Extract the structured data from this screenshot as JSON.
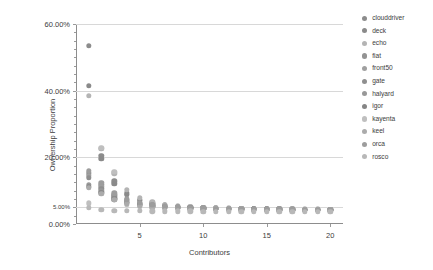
{
  "chart_data": {
    "type": "scatter",
    "title": "",
    "xlabel": "Contributors",
    "ylabel": "Ownership Proportion",
    "xlim": [
      0,
      21
    ],
    "ylim": [
      0,
      0.6
    ],
    "grid": true,
    "legend_position": "right",
    "y_ticks": [
      {
        "value": 0.0,
        "label": "0.00%",
        "size": "normal"
      },
      {
        "value": 0.05,
        "label": "5.00%",
        "size": "small"
      },
      {
        "value": 0.2,
        "label": "20.00%",
        "size": "normal"
      },
      {
        "value": 0.4,
        "label": "40.00%",
        "size": "normal"
      },
      {
        "value": 0.6,
        "label": "60.00%",
        "size": "normal"
      }
    ],
    "y_minor_ticks": [
      0.025,
      0.075,
      0.1,
      0.125,
      0.15,
      0.175,
      0.225,
      0.25,
      0.275,
      0.3,
      0.325,
      0.35,
      0.375,
      0.425,
      0.45,
      0.475,
      0.5,
      0.525,
      0.55,
      0.575
    ],
    "x_ticks": [
      {
        "value": 5,
        "label": "5"
      },
      {
        "value": 10,
        "label": "10"
      },
      {
        "value": 15,
        "label": "15"
      },
      {
        "value": 20,
        "label": "20"
      }
    ],
    "series": [
      {
        "name": "clouddriver",
        "color": "#8c8c8c",
        "points": [
          {
            "x": 1,
            "y": 0.535
          },
          {
            "x": 2,
            "y": 0.205
          },
          {
            "x": 3,
            "y": 0.128
          },
          {
            "x": 4,
            "y": 0.092
          },
          {
            "x": 5,
            "y": 0.073
          },
          {
            "x": 6,
            "y": 0.062
          },
          {
            "x": 7,
            "y": 0.056
          },
          {
            "x": 8,
            "y": 0.052
          },
          {
            "x": 9,
            "y": 0.05
          },
          {
            "x": 10,
            "y": 0.048
          },
          {
            "x": 11,
            "y": 0.047
          },
          {
            "x": 12,
            "y": 0.046
          },
          {
            "x": 13,
            "y": 0.045
          },
          {
            "x": 14,
            "y": 0.045
          },
          {
            "x": 15,
            "y": 0.044
          },
          {
            "x": 16,
            "y": 0.044
          },
          {
            "x": 17,
            "y": 0.043
          },
          {
            "x": 18,
            "y": 0.043
          },
          {
            "x": 19,
            "y": 0.043
          },
          {
            "x": 20,
            "y": 0.042
          }
        ]
      },
      {
        "name": "deck",
        "color": "#8a8a8a",
        "points": [
          {
            "x": 1,
            "y": 0.415
          },
          {
            "x": 2,
            "y": 0.196
          },
          {
            "x": 3,
            "y": 0.121
          },
          {
            "x": 4,
            "y": 0.088
          },
          {
            "x": 5,
            "y": 0.07
          },
          {
            "x": 6,
            "y": 0.06
          },
          {
            "x": 7,
            "y": 0.055
          },
          {
            "x": 8,
            "y": 0.051
          },
          {
            "x": 9,
            "y": 0.049
          },
          {
            "x": 10,
            "y": 0.048
          },
          {
            "x": 11,
            "y": 0.047
          },
          {
            "x": 12,
            "y": 0.046
          },
          {
            "x": 13,
            "y": 0.045
          },
          {
            "x": 14,
            "y": 0.045
          },
          {
            "x": 15,
            "y": 0.044
          },
          {
            "x": 16,
            "y": 0.044
          },
          {
            "x": 17,
            "y": 0.044
          },
          {
            "x": 18,
            "y": 0.043
          },
          {
            "x": 19,
            "y": 0.043
          },
          {
            "x": 20,
            "y": 0.043
          }
        ]
      },
      {
        "name": "echo",
        "color": "#b4b4b4",
        "points": [
          {
            "x": 1,
            "y": 0.385
          },
          {
            "x": 2,
            "y": 0.226
          },
          {
            "x": 3,
            "y": 0.152
          },
          {
            "x": 4,
            "y": 0.102
          },
          {
            "x": 5,
            "y": 0.078
          },
          {
            "x": 6,
            "y": 0.065
          },
          {
            "x": 7,
            "y": 0.058
          },
          {
            "x": 8,
            "y": 0.054
          },
          {
            "x": 9,
            "y": 0.051
          },
          {
            "x": 10,
            "y": 0.049
          },
          {
            "x": 11,
            "y": 0.048
          },
          {
            "x": 12,
            "y": 0.047
          },
          {
            "x": 13,
            "y": 0.046
          },
          {
            "x": 14,
            "y": 0.046
          },
          {
            "x": 15,
            "y": 0.045
          },
          {
            "x": 16,
            "y": 0.045
          },
          {
            "x": 17,
            "y": 0.044
          },
          {
            "x": 18,
            "y": 0.044
          },
          {
            "x": 19,
            "y": 0.044
          },
          {
            "x": 20,
            "y": 0.043
          }
        ]
      },
      {
        "name": "fiat",
        "color": "#939393",
        "points": [
          {
            "x": 1,
            "y": 0.152
          },
          {
            "x": 2,
            "y": 0.118
          },
          {
            "x": 3,
            "y": 0.088
          },
          {
            "x": 4,
            "y": 0.072
          },
          {
            "x": 5,
            "y": 0.062
          },
          {
            "x": 6,
            "y": 0.056
          },
          {
            "x": 7,
            "y": 0.052
          },
          {
            "x": 8,
            "y": 0.05
          },
          {
            "x": 9,
            "y": 0.048
          },
          {
            "x": 10,
            "y": 0.047
          },
          {
            "x": 11,
            "y": 0.046
          },
          {
            "x": 12,
            "y": 0.045
          },
          {
            "x": 13,
            "y": 0.045
          },
          {
            "x": 14,
            "y": 0.044
          },
          {
            "x": 15,
            "y": 0.044
          },
          {
            "x": 16,
            "y": 0.044
          },
          {
            "x": 17,
            "y": 0.043
          },
          {
            "x": 18,
            "y": 0.043
          },
          {
            "x": 19,
            "y": 0.043
          },
          {
            "x": 20,
            "y": 0.042
          }
        ]
      },
      {
        "name": "front50",
        "color": "#a0a0a0",
        "points": [
          {
            "x": 1,
            "y": 0.145
          },
          {
            "x": 2,
            "y": 0.112
          },
          {
            "x": 3,
            "y": 0.084
          },
          {
            "x": 4,
            "y": 0.07
          },
          {
            "x": 5,
            "y": 0.06
          },
          {
            "x": 6,
            "y": 0.055
          },
          {
            "x": 7,
            "y": 0.052
          },
          {
            "x": 8,
            "y": 0.049
          },
          {
            "x": 9,
            "y": 0.048
          },
          {
            "x": 10,
            "y": 0.047
          },
          {
            "x": 11,
            "y": 0.046
          },
          {
            "x": 12,
            "y": 0.045
          },
          {
            "x": 13,
            "y": 0.045
          },
          {
            "x": 14,
            "y": 0.044
          },
          {
            "x": 15,
            "y": 0.044
          },
          {
            "x": 16,
            "y": 0.043
          },
          {
            "x": 17,
            "y": 0.043
          },
          {
            "x": 18,
            "y": 0.043
          },
          {
            "x": 19,
            "y": 0.042
          },
          {
            "x": 20,
            "y": 0.042
          }
        ]
      },
      {
        "name": "gate",
        "color": "#8f8f8f",
        "points": [
          {
            "x": 1,
            "y": 0.138
          },
          {
            "x": 2,
            "y": 0.106
          },
          {
            "x": 3,
            "y": 0.08
          },
          {
            "x": 4,
            "y": 0.067
          },
          {
            "x": 5,
            "y": 0.059
          },
          {
            "x": 6,
            "y": 0.054
          },
          {
            "x": 7,
            "y": 0.051
          },
          {
            "x": 8,
            "y": 0.049
          },
          {
            "x": 9,
            "y": 0.047
          },
          {
            "x": 10,
            "y": 0.046
          },
          {
            "x": 11,
            "y": 0.046
          },
          {
            "x": 12,
            "y": 0.045
          },
          {
            "x": 13,
            "y": 0.044
          },
          {
            "x": 14,
            "y": 0.044
          },
          {
            "x": 15,
            "y": 0.044
          },
          {
            "x": 16,
            "y": 0.043
          },
          {
            "x": 17,
            "y": 0.043
          },
          {
            "x": 18,
            "y": 0.043
          },
          {
            "x": 19,
            "y": 0.042
          },
          {
            "x": 20,
            "y": 0.042
          }
        ]
      },
      {
        "name": "halyard",
        "color": "#989898",
        "points": [
          {
            "x": 1,
            "y": 0.118
          },
          {
            "x": 2,
            "y": 0.098
          },
          {
            "x": 3,
            "y": 0.076
          },
          {
            "x": 4,
            "y": 0.064
          },
          {
            "x": 5,
            "y": 0.057
          },
          {
            "x": 6,
            "y": 0.053
          },
          {
            "x": 7,
            "y": 0.05
          },
          {
            "x": 8,
            "y": 0.048
          },
          {
            "x": 9,
            "y": 0.047
          },
          {
            "x": 10,
            "y": 0.046
          },
          {
            "x": 11,
            "y": 0.045
          },
          {
            "x": 12,
            "y": 0.045
          },
          {
            "x": 13,
            "y": 0.044
          },
          {
            "x": 14,
            "y": 0.044
          },
          {
            "x": 15,
            "y": 0.043
          },
          {
            "x": 16,
            "y": 0.043
          },
          {
            "x": 17,
            "y": 0.043
          },
          {
            "x": 18,
            "y": 0.042
          },
          {
            "x": 19,
            "y": 0.042
          },
          {
            "x": 20,
            "y": 0.042
          }
        ]
      },
      {
        "name": "igor",
        "color": "#858585",
        "points": [
          {
            "x": 1,
            "y": 0.112
          },
          {
            "x": 2,
            "y": 0.094
          },
          {
            "x": 3,
            "y": 0.074
          },
          {
            "x": 4,
            "y": 0.063
          },
          {
            "x": 5,
            "y": 0.056
          },
          {
            "x": 6,
            "y": 0.052
          },
          {
            "x": 7,
            "y": 0.05
          },
          {
            "x": 8,
            "y": 0.048
          },
          {
            "x": 9,
            "y": 0.047
          },
          {
            "x": 10,
            "y": 0.046
          },
          {
            "x": 11,
            "y": 0.045
          },
          {
            "x": 12,
            "y": 0.044
          },
          {
            "x": 13,
            "y": 0.044
          },
          {
            "x": 14,
            "y": 0.044
          },
          {
            "x": 15,
            "y": 0.043
          },
          {
            "x": 16,
            "y": 0.043
          },
          {
            "x": 17,
            "y": 0.043
          },
          {
            "x": 18,
            "y": 0.042
          },
          {
            "x": 19,
            "y": 0.042
          },
          {
            "x": 20,
            "y": 0.042
          }
        ]
      },
      {
        "name": "kayenta",
        "color": "#bfbfbf",
        "points": [
          {
            "x": 1,
            "y": 0.062
          },
          {
            "x": 2,
            "y": 0.229
          },
          {
            "x": 3,
            "y": 0.157
          },
          {
            "x": 4,
            "y": 0.058
          },
          {
            "x": 5,
            "y": 0.052
          },
          {
            "x": 6,
            "y": 0.05
          },
          {
            "x": 7,
            "y": 0.048
          },
          {
            "x": 8,
            "y": 0.047
          },
          {
            "x": 9,
            "y": 0.046
          },
          {
            "x": 10,
            "y": 0.045
          },
          {
            "x": 11,
            "y": 0.045
          },
          {
            "x": 12,
            "y": 0.044
          },
          {
            "x": 13,
            "y": 0.044
          },
          {
            "x": 14,
            "y": 0.043
          },
          {
            "x": 15,
            "y": 0.043
          },
          {
            "x": 16,
            "y": 0.043
          },
          {
            "x": 17,
            "y": 0.043
          },
          {
            "x": 18,
            "y": 0.042
          },
          {
            "x": 19,
            "y": 0.042
          },
          {
            "x": 20,
            "y": 0.042
          }
        ]
      },
      {
        "name": "keel",
        "color": "#ababab",
        "points": [
          {
            "x": 1,
            "y": 0.108
          },
          {
            "x": 2,
            "y": 0.09
          },
          {
            "x": 3,
            "y": 0.072
          },
          {
            "x": 4,
            "y": 0.062
          },
          {
            "x": 5,
            "y": 0.055
          },
          {
            "x": 6,
            "y": 0.052
          },
          {
            "x": 7,
            "y": 0.049
          },
          {
            "x": 8,
            "y": 0.048
          },
          {
            "x": 9,
            "y": 0.046
          },
          {
            "x": 10,
            "y": 0.046
          },
          {
            "x": 11,
            "y": 0.045
          },
          {
            "x": 12,
            "y": 0.044
          },
          {
            "x": 13,
            "y": 0.044
          },
          {
            "x": 14,
            "y": 0.043
          },
          {
            "x": 15,
            "y": 0.043
          },
          {
            "x": 16,
            "y": 0.043
          },
          {
            "x": 17,
            "y": 0.042
          },
          {
            "x": 18,
            "y": 0.042
          },
          {
            "x": 19,
            "y": 0.042
          },
          {
            "x": 20,
            "y": 0.041
          }
        ]
      },
      {
        "name": "orca",
        "color": "#9d9d9d",
        "points": [
          {
            "x": 1,
            "y": 0.16
          },
          {
            "x": 2,
            "y": 0.124
          },
          {
            "x": 3,
            "y": 0.092
          },
          {
            "x": 4,
            "y": 0.074
          },
          {
            "x": 5,
            "y": 0.063
          },
          {
            "x": 6,
            "y": 0.057
          },
          {
            "x": 7,
            "y": 0.053
          },
          {
            "x": 8,
            "y": 0.05
          },
          {
            "x": 9,
            "y": 0.048
          },
          {
            "x": 10,
            "y": 0.047
          },
          {
            "x": 11,
            "y": 0.046
          },
          {
            "x": 12,
            "y": 0.046
          },
          {
            "x": 13,
            "y": 0.045
          },
          {
            "x": 14,
            "y": 0.045
          },
          {
            "x": 15,
            "y": 0.044
          },
          {
            "x": 16,
            "y": 0.044
          },
          {
            "x": 17,
            "y": 0.044
          },
          {
            "x": 18,
            "y": 0.043
          },
          {
            "x": 19,
            "y": 0.043
          },
          {
            "x": 20,
            "y": 0.043
          }
        ]
      },
      {
        "name": "rosco",
        "color": "#b8b8b8",
        "points": [
          {
            "x": 1,
            "y": 0.048
          },
          {
            "x": 2,
            "y": 0.042
          },
          {
            "x": 3,
            "y": 0.04
          },
          {
            "x": 4,
            "y": 0.039
          },
          {
            "x": 5,
            "y": 0.039
          },
          {
            "x": 6,
            "y": 0.038
          },
          {
            "x": 7,
            "y": 0.038
          },
          {
            "x": 8,
            "y": 0.038
          },
          {
            "x": 9,
            "y": 0.038
          },
          {
            "x": 10,
            "y": 0.037
          },
          {
            "x": 11,
            "y": 0.037
          },
          {
            "x": 12,
            "y": 0.037
          },
          {
            "x": 13,
            "y": 0.037
          },
          {
            "x": 14,
            "y": 0.037
          },
          {
            "x": 15,
            "y": 0.037
          },
          {
            "x": 16,
            "y": 0.037
          },
          {
            "x": 17,
            "y": 0.037
          },
          {
            "x": 18,
            "y": 0.036
          },
          {
            "x": 19,
            "y": 0.036
          },
          {
            "x": 20,
            "y": 0.036
          }
        ]
      }
    ]
  }
}
